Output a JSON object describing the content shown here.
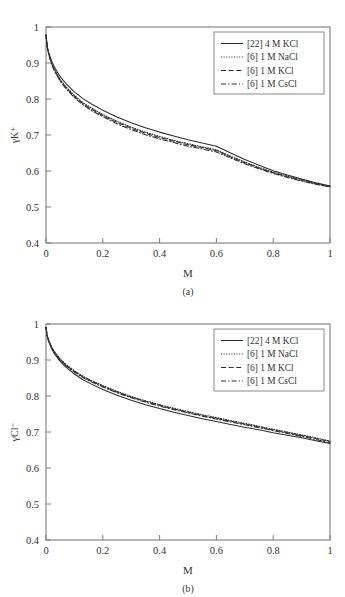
{
  "figure": {
    "panels": [
      {
        "id": "a",
        "subcaption": "(a)",
        "ylabel": "γK⁺",
        "xlabel": "M"
      },
      {
        "id": "b",
        "subcaption": "(b)",
        "ylabel": "γCl⁻",
        "xlabel": "M"
      }
    ]
  },
  "chart_data": [
    {
      "type": "line",
      "panel": "a",
      "title": "",
      "xlabel": "M",
      "ylabel": "γK+",
      "xlim": [
        0,
        1
      ],
      "ylim": [
        0.4,
        1
      ],
      "xticks": [
        0,
        0.2,
        0.4,
        0.6,
        0.8,
        1
      ],
      "xticklabels": [
        "0",
        "0.2",
        "0.4",
        "0.6",
        "0.8",
        "1"
      ],
      "yticks": [
        0.4,
        0.5,
        0.6,
        0.7,
        0.8,
        0.9,
        1
      ],
      "yticklabels": [
        "0.4",
        "0.5",
        "0.6",
        "0.7",
        "0.8",
        "0.9",
        "1"
      ],
      "grid": false,
      "legend_position": "upper-right",
      "x": [
        0,
        0.005,
        0.01,
        0.02,
        0.03,
        0.05,
        0.07,
        0.1,
        0.13,
        0.16,
        0.2,
        0.25,
        0.3,
        0.35,
        0.4,
        0.45,
        0.5,
        0.55,
        0.6,
        0.65,
        0.7,
        0.75,
        0.8,
        0.85,
        0.9,
        0.95,
        1
      ],
      "series": [
        {
          "name": "[22] 4 M KCl",
          "style": "solid",
          "values": [
            0.978,
            0.944,
            0.928,
            0.905,
            0.888,
            0.862,
            0.843,
            0.82,
            0.801,
            0.786,
            0.769,
            0.75,
            0.734,
            0.72,
            0.708,
            0.697,
            0.687,
            0.678,
            0.669,
            0.65,
            0.632,
            0.616,
            0.601,
            0.589,
            0.578,
            0.567,
            0.558
          ]
        },
        {
          "name": "[6] 1 M NaCl",
          "style": "dotted",
          "values": [
            0.978,
            0.942,
            0.925,
            0.9,
            0.882,
            0.854,
            0.834,
            0.81,
            0.79,
            0.775,
            0.757,
            0.738,
            0.722,
            0.708,
            0.696,
            0.685,
            0.676,
            0.667,
            0.659,
            0.641,
            0.625,
            0.61,
            0.597,
            0.586,
            0.576,
            0.566,
            0.558
          ]
        },
        {
          "name": "[6] 1 M KCl",
          "style": "dashed",
          "values": [
            0.978,
            0.941,
            0.924,
            0.898,
            0.88,
            0.852,
            0.832,
            0.807,
            0.787,
            0.772,
            0.754,
            0.735,
            0.719,
            0.705,
            0.693,
            0.683,
            0.673,
            0.665,
            0.657,
            0.639,
            0.623,
            0.608,
            0.595,
            0.584,
            0.574,
            0.564,
            0.556
          ]
        },
        {
          "name": "[6] 1 M CsCl",
          "style": "dashdot",
          "values": [
            0.978,
            0.94,
            0.922,
            0.896,
            0.877,
            0.849,
            0.829,
            0.804,
            0.784,
            0.768,
            0.751,
            0.731,
            0.715,
            0.701,
            0.689,
            0.679,
            0.669,
            0.661,
            0.653,
            0.636,
            0.62,
            0.606,
            0.593,
            0.582,
            0.572,
            0.563,
            0.556
          ]
        }
      ]
    },
    {
      "type": "line",
      "panel": "b",
      "title": "",
      "xlabel": "M",
      "ylabel": "γCl-",
      "xlim": [
        0,
        1
      ],
      "ylim": [
        0.4,
        1
      ],
      "xticks": [
        0,
        0.2,
        0.4,
        0.6,
        0.8,
        1
      ],
      "xticklabels": [
        "0",
        "0.2",
        "0.4",
        "0.6",
        "0.8",
        "1"
      ],
      "yticks": [
        0.4,
        0.5,
        0.6,
        0.7,
        0.8,
        0.9,
        1
      ],
      "yticklabels": [
        "0.4",
        "0.5",
        "0.6",
        "0.7",
        "0.8",
        "0.9",
        "1"
      ],
      "grid": false,
      "legend_position": "upper-right",
      "x": [
        0,
        0.005,
        0.01,
        0.02,
        0.03,
        0.05,
        0.07,
        0.1,
        0.13,
        0.16,
        0.2,
        0.25,
        0.3,
        0.35,
        0.4,
        0.45,
        0.5,
        0.55,
        0.6,
        0.65,
        0.7,
        0.75,
        0.8,
        0.85,
        0.9,
        0.95,
        1
      ],
      "series": [
        {
          "name": "[22] 4 M KCl",
          "style": "solid",
          "values": [
            0.99,
            0.963,
            0.95,
            0.931,
            0.917,
            0.896,
            0.88,
            0.861,
            0.845,
            0.833,
            0.818,
            0.802,
            0.788,
            0.776,
            0.765,
            0.755,
            0.746,
            0.737,
            0.729,
            0.721,
            0.713,
            0.706,
            0.698,
            0.691,
            0.684,
            0.676,
            0.668
          ]
        },
        {
          "name": "[6] 1 M NaCl",
          "style": "dotted",
          "values": [
            0.99,
            0.966,
            0.954,
            0.936,
            0.923,
            0.903,
            0.888,
            0.87,
            0.855,
            0.843,
            0.829,
            0.813,
            0.799,
            0.787,
            0.776,
            0.766,
            0.757,
            0.748,
            0.74,
            0.732,
            0.724,
            0.716,
            0.708,
            0.7,
            0.692,
            0.684,
            0.675
          ]
        },
        {
          "name": "[6] 1 M KCl",
          "style": "dashed",
          "values": [
            0.99,
            0.965,
            0.953,
            0.934,
            0.921,
            0.901,
            0.886,
            0.868,
            0.853,
            0.841,
            0.827,
            0.811,
            0.797,
            0.785,
            0.774,
            0.764,
            0.755,
            0.746,
            0.738,
            0.73,
            0.722,
            0.714,
            0.706,
            0.698,
            0.69,
            0.682,
            0.673
          ]
        },
        {
          "name": "[6] 1 M CsCl",
          "style": "dashdot",
          "values": [
            0.99,
            0.964,
            0.952,
            0.933,
            0.92,
            0.899,
            0.884,
            0.866,
            0.851,
            0.839,
            0.825,
            0.809,
            0.795,
            0.783,
            0.772,
            0.762,
            0.753,
            0.744,
            0.736,
            0.728,
            0.72,
            0.712,
            0.704,
            0.696,
            0.688,
            0.679,
            0.67
          ]
        }
      ]
    }
  ]
}
